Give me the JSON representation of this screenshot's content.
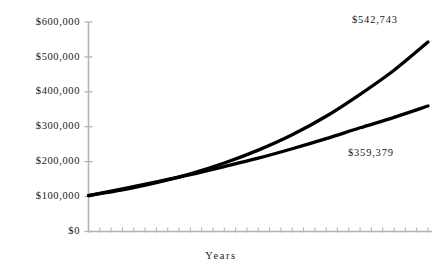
{
  "chart_data": {
    "type": "line",
    "title": "",
    "xlabel": "Years",
    "ylabel": "",
    "ylim": [
      0,
      600000
    ],
    "xlim": [
      0,
      30
    ],
    "grid": false,
    "legend": null,
    "ytick_labels": [
      "$600,000",
      "$500,000",
      "$400,000",
      "$300,000",
      "$200,000",
      "$100,000",
      "$0"
    ],
    "ytick_values": [
      600000,
      500000,
      400000,
      300000,
      200000,
      100000,
      0
    ],
    "xtick_count": 30,
    "xtick_labels": [],
    "x": [
      0,
      3,
      6,
      9,
      12,
      15,
      18,
      21,
      24,
      27,
      30
    ],
    "series": [
      {
        "name": "upper-series",
        "end_label": "$542,743",
        "end_value": 542743,
        "color": "#000000",
        "values": [
          103000,
          119000,
          140000,
          165000,
          196000,
          233000,
          277000,
          330000,
          393000,
          462000,
          542743
        ]
      },
      {
        "name": "lower-series",
        "end_label": "$359,379",
        "end_value": 359379,
        "color": "#000000",
        "values": [
          103000,
          122000,
          142000,
          163000,
          186000,
          210000,
          237000,
          266000,
          297000,
          327000,
          359379
        ]
      }
    ],
    "annotations": [
      {
        "text": "$542,743",
        "series": "upper-series"
      },
      {
        "text": "$359,379",
        "series": "lower-series"
      }
    ],
    "colors": {
      "line": "#000000",
      "axis": "#b4b4b4",
      "text": "#1a1a1a",
      "background": "#ffffff"
    }
  },
  "yticks": [
    {
      "label": "$600,000",
      "top": 17
    },
    {
      "label": "$500,000",
      "top": 52
    },
    {
      "label": "$400,000",
      "top": 86
    },
    {
      "label": "$300,000",
      "top": 121
    },
    {
      "label": "$200,000",
      "top": 156
    },
    {
      "label": "$100,000",
      "top": 191
    },
    {
      "label": "$0",
      "top": 226
    }
  ],
  "axis": {
    "xlabel": "Years"
  },
  "callouts": {
    "upper": "$542,743",
    "lower": "$359,379"
  }
}
